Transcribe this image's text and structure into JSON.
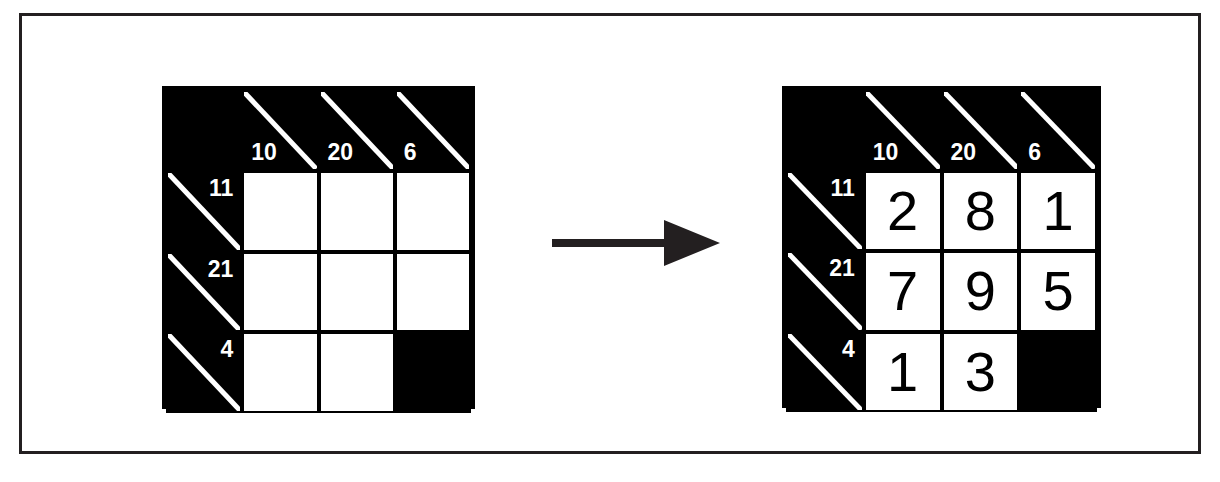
{
  "figure": {
    "type": "kakuro-puzzle-and-solution",
    "colors": {
      "frame": "#231f20",
      "grid_line": "#000000",
      "clue_cell_fill": "#000000",
      "clue_text": "#ffffff",
      "solution_text": "#000000",
      "background": "#ffffff",
      "arrow": "#231f20"
    },
    "arrow_label": "leads to"
  },
  "puzzle": {
    "title": "Kakuro puzzle (unsolved)",
    "rows": [
      [
        {
          "kind": "blank",
          "across": "",
          "down": "",
          "value": ""
        },
        {
          "kind": "clue",
          "across": "",
          "down": "10",
          "value": ""
        },
        {
          "kind": "clue",
          "across": "",
          "down": "20",
          "value": ""
        },
        {
          "kind": "clue",
          "across": "",
          "down": "6",
          "value": ""
        }
      ],
      [
        {
          "kind": "clue",
          "across": "11",
          "down": "",
          "value": ""
        },
        {
          "kind": "entry",
          "across": "",
          "down": "",
          "value": ""
        },
        {
          "kind": "entry",
          "across": "",
          "down": "",
          "value": ""
        },
        {
          "kind": "entry",
          "across": "",
          "down": "",
          "value": ""
        }
      ],
      [
        {
          "kind": "clue",
          "across": "21",
          "down": "",
          "value": ""
        },
        {
          "kind": "entry",
          "across": "",
          "down": "",
          "value": ""
        },
        {
          "kind": "entry",
          "across": "",
          "down": "",
          "value": ""
        },
        {
          "kind": "entry",
          "across": "",
          "down": "",
          "value": ""
        }
      ],
      [
        {
          "kind": "clue",
          "across": "4",
          "down": "",
          "value": ""
        },
        {
          "kind": "entry",
          "across": "",
          "down": "",
          "value": ""
        },
        {
          "kind": "entry",
          "across": "",
          "down": "",
          "value": ""
        },
        {
          "kind": "blank",
          "across": "",
          "down": "",
          "value": ""
        }
      ]
    ]
  },
  "solution": {
    "title": "Kakuro puzzle (solved)",
    "rows": [
      [
        {
          "kind": "blank",
          "across": "",
          "down": "",
          "value": ""
        },
        {
          "kind": "clue",
          "across": "",
          "down": "10",
          "value": ""
        },
        {
          "kind": "clue",
          "across": "",
          "down": "20",
          "value": ""
        },
        {
          "kind": "clue",
          "across": "",
          "down": "6",
          "value": ""
        }
      ],
      [
        {
          "kind": "clue",
          "across": "11",
          "down": "",
          "value": ""
        },
        {
          "kind": "entry",
          "across": "",
          "down": "",
          "value": "2"
        },
        {
          "kind": "entry",
          "across": "",
          "down": "",
          "value": "8"
        },
        {
          "kind": "entry",
          "across": "",
          "down": "",
          "value": "1"
        }
      ],
      [
        {
          "kind": "clue",
          "across": "21",
          "down": "",
          "value": ""
        },
        {
          "kind": "entry",
          "across": "",
          "down": "",
          "value": "7"
        },
        {
          "kind": "entry",
          "across": "",
          "down": "",
          "value": "9"
        },
        {
          "kind": "entry",
          "across": "",
          "down": "",
          "value": "5"
        }
      ],
      [
        {
          "kind": "clue",
          "across": "4",
          "down": "",
          "value": ""
        },
        {
          "kind": "entry",
          "across": "",
          "down": "",
          "value": "1"
        },
        {
          "kind": "entry",
          "across": "",
          "down": "",
          "value": "3"
        },
        {
          "kind": "blank",
          "across": "",
          "down": "",
          "value": ""
        }
      ]
    ]
  }
}
